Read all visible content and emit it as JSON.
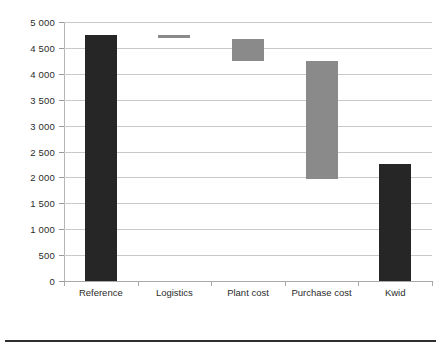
{
  "chart_data": {
    "type": "bar",
    "chart_subtype": "waterfall",
    "title": "",
    "subtitle": "",
    "xlabel": "",
    "ylabel": "",
    "categories": [
      "Reference",
      "Logistics",
      "Plant cost",
      "Purchase cost",
      "Kwid"
    ],
    "ylim": [
      0,
      5000
    ],
    "ytick_values": [
      0,
      500,
      1000,
      1500,
      2000,
      2500,
      3000,
      3500,
      4000,
      4500,
      5000
    ],
    "ytick_labels": [
      "0",
      "500",
      "1 000",
      "1 500",
      "2 000",
      "2 500",
      "3 000",
      "3 500",
      "4 000",
      "4 500",
      "5 000"
    ],
    "grid": true,
    "grid_axis": "y",
    "legend": false,
    "legend_position": "none",
    "bars": [
      {
        "category": "Reference",
        "base": 0,
        "top": 4750,
        "value": 4750,
        "kind": "total",
        "color": "#262626"
      },
      {
        "category": "Logistics",
        "base": 4700,
        "top": 4750,
        "value": -50,
        "kind": "decrease",
        "color": "#8a8a8a"
      },
      {
        "category": "Plant cost",
        "base": 4250,
        "top": 4670,
        "value": -420,
        "kind": "decrease",
        "color": "#8a8a8a"
      },
      {
        "category": "Purchase cost",
        "base": 1970,
        "top": 4250,
        "value": -2280,
        "kind": "decrease",
        "color": "#8a8a8a"
      },
      {
        "category": "Kwid",
        "base": 0,
        "top": 2250,
        "value": 2250,
        "kind": "total",
        "color": "#262626"
      }
    ],
    "series": [
      {
        "name": "bar-extent",
        "values": [
          4750,
          50,
          420,
          2280,
          2250
        ]
      }
    ],
    "colors": {
      "total_bar": "#262626",
      "step_bar": "#8a8a8a",
      "gridline": "#c9c9c9",
      "axis": "#b5b5b5",
      "text": "#2b2b2b",
      "background": "#ffffff",
      "bottom_rule": "#2e2e2e"
    }
  }
}
